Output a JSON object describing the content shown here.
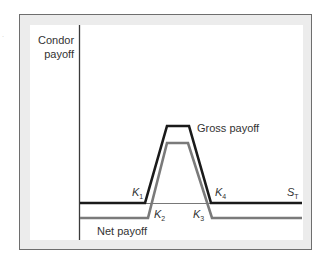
{
  "chart_data": {
    "type": "line",
    "title": "",
    "ylabel": "Condor payoff",
    "xlabel": "S_T",
    "x_label_display": "S",
    "x_label_sub": "T",
    "series": [
      {
        "name": "Gross payoff",
        "color": "#1a1a1a",
        "points": [
          [
            80,
            203
          ],
          [
            145,
            203
          ],
          [
            167,
            126
          ],
          [
            189,
            126
          ],
          [
            211,
            203
          ],
          [
            302,
            203
          ]
        ]
      },
      {
        "name": "Net payoff",
        "color": "#7a7a7a",
        "points": [
          [
            80,
            218
          ],
          [
            148,
            218
          ],
          [
            167,
            143
          ],
          [
            188,
            143
          ],
          [
            212,
            218
          ],
          [
            302,
            218
          ]
        ]
      }
    ],
    "strike_labels": [
      {
        "name": "K",
        "sub": "1"
      },
      {
        "name": "K",
        "sub": "2"
      },
      {
        "name": "K",
        "sub": "3"
      },
      {
        "name": "K",
        "sub": "4"
      }
    ],
    "annotations": [
      "Gross payoff",
      "Net payoff"
    ],
    "grid": false,
    "legend": "inline"
  },
  "labels": {
    "y_line1": "Condor",
    "y_line2": "payoff",
    "gross": "Gross payoff",
    "net": "Net payoff",
    "k": "K",
    "k1": "1",
    "k2": "2",
    "k3": "3",
    "k4": "4",
    "s": "S",
    "t": "T"
  }
}
